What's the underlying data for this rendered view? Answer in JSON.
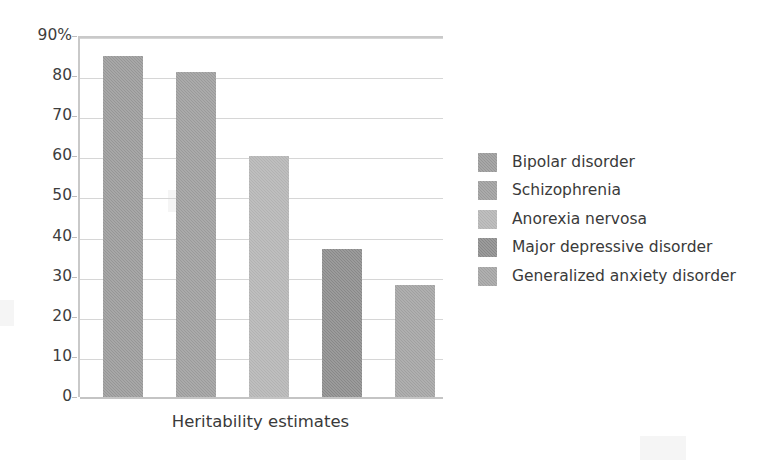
{
  "chart_data": {
    "type": "bar",
    "title": "",
    "xlabel": "Heritability estimates",
    "ylabel": "",
    "categories": [
      "Bipolar disorder",
      "Schizophrenia",
      "Anorexia nervosa",
      "Major depressive disorder",
      "Generalized anxiety disorder"
    ],
    "values": [
      85,
      81,
      60,
      37,
      28
    ],
    "ylim": [
      0,
      90
    ],
    "ytick_values": [
      0,
      10,
      20,
      30,
      40,
      50,
      60,
      70,
      80,
      90
    ],
    "ytick_labels": [
      "0",
      "10",
      "20",
      "30",
      "40",
      "50",
      "60",
      "70",
      "80",
      "90%"
    ],
    "grid": true,
    "legend_position": "right",
    "bar_colors": [
      "#969696",
      "#9a9a9a",
      "#b2b2b2",
      "#888888",
      "#a0a0a0"
    ]
  },
  "axes": {
    "x_title": "Heritability estimates"
  },
  "legend": {
    "items": [
      {
        "label": "Bipolar disorder",
        "color": "#969696"
      },
      {
        "label": "Schizophrenia",
        "color": "#9a9a9a"
      },
      {
        "label": "Anorexia nervosa",
        "color": "#b2b2b2"
      },
      {
        "label": "Major depressive disorder",
        "color": "#888888"
      },
      {
        "label": "Generalized anxiety disorder",
        "color": "#a0a0a0"
      }
    ]
  }
}
